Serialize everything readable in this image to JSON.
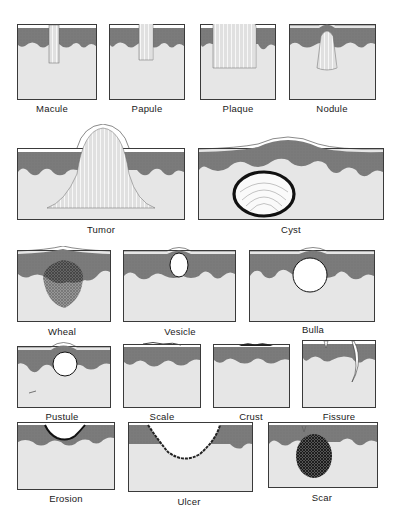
{
  "figure": {
    "title": "",
    "colors": {
      "dermis": "#e6e6e6",
      "epidermis": "#7b7b7b",
      "stratum_corneum": "#ffffff",
      "outline": "#3a3a3a",
      "lesion": "#fafafa",
      "dark_lesion": "#2a2a2a"
    },
    "lesions": [
      {
        "id": "macule",
        "label": "Macule",
        "row": 1
      },
      {
        "id": "papule",
        "label": "Papule",
        "row": 1
      },
      {
        "id": "plaque",
        "label": "Plaque",
        "row": 1
      },
      {
        "id": "nodule",
        "label": "Nodule",
        "row": 1
      },
      {
        "id": "tumor",
        "label": "Tumor",
        "row": 2
      },
      {
        "id": "cyst",
        "label": "Cyst",
        "row": 2
      },
      {
        "id": "wheal",
        "label": "Wheal",
        "row": 3
      },
      {
        "id": "vesicle",
        "label": "Vesicle",
        "row": 3
      },
      {
        "id": "bulla",
        "label": "Bulla",
        "row": 3
      },
      {
        "id": "pustule",
        "label": "Pustule",
        "row": 4
      },
      {
        "id": "scale",
        "label": "Scale",
        "row": 4
      },
      {
        "id": "crust",
        "label": "Crust",
        "row": 4
      },
      {
        "id": "fissure",
        "label": "Fissure",
        "row": 4
      },
      {
        "id": "erosion",
        "label": "Erosion",
        "row": 5
      },
      {
        "id": "ulcer",
        "label": "Ulcer",
        "row": 5
      },
      {
        "id": "scar",
        "label": "Scar",
        "row": 5
      }
    ]
  }
}
